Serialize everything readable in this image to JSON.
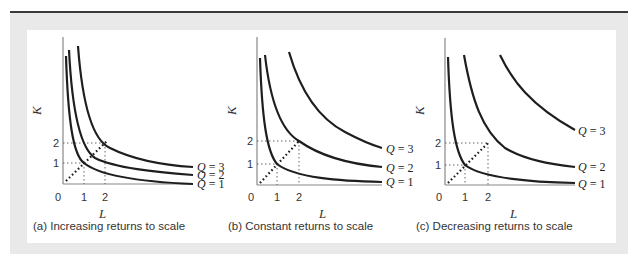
{
  "figure": {
    "panels": [
      {
        "id": "a",
        "caption": "(a) Increasing returns to scale",
        "y_axis_label": "K",
        "x_axis_label": "L",
        "origin_label": "0",
        "x_ticks": [
          "1",
          "2"
        ],
        "y_ticks": [
          "1",
          "2"
        ],
        "isoquants": [
          {
            "label_var": "Q",
            "label_eq": " = 3",
            "value": 3
          },
          {
            "label_var": "Q",
            "label_eq": " = 2",
            "value": 2
          },
          {
            "label_var": "Q",
            "label_eq": " = 1",
            "value": 1
          }
        ]
      },
      {
        "id": "b",
        "caption": "(b) Constant returns to scale",
        "y_axis_label": "K",
        "x_axis_label": "L",
        "origin_label": "0",
        "x_ticks": [
          "1",
          "2"
        ],
        "y_ticks": [
          "1",
          "2"
        ],
        "isoquants": [
          {
            "label_var": "Q",
            "label_eq": " = 3",
            "value": 3
          },
          {
            "label_var": "Q",
            "label_eq": " = 2",
            "value": 2
          },
          {
            "label_var": "Q",
            "label_eq": " = 1",
            "value": 1
          }
        ]
      },
      {
        "id": "c",
        "caption": "(c) Decreasing returns to scale",
        "y_axis_label": "K",
        "x_axis_label": "L",
        "origin_label": "0",
        "x_ticks": [
          "1",
          "2"
        ],
        "y_ticks": [
          "1",
          "2"
        ],
        "isoquants": [
          {
            "label_var": "Q",
            "label_eq": " = 3",
            "value": 3
          },
          {
            "label_var": "Q",
            "label_eq": " = 2",
            "value": 2
          },
          {
            "label_var": "Q",
            "label_eq": " = 1",
            "value": 1
          }
        ]
      }
    ],
    "colors": {
      "curve": "#1e1e1e",
      "axis": "#888888",
      "guide": "#555555",
      "ray": "#1e1e1e",
      "frame": "#e9e9e9",
      "top_rule": "#3a3a3a"
    }
  }
}
